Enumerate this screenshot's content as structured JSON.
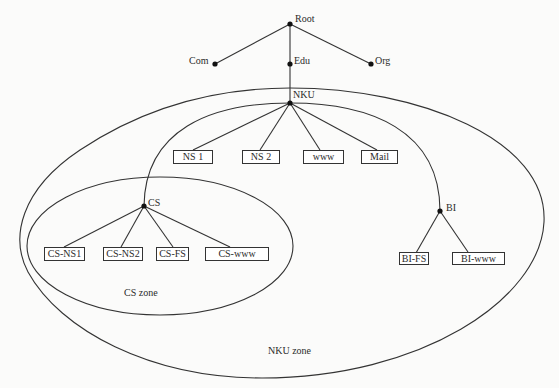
{
  "diagram": {
    "type": "DNS hierarchy with zones",
    "colors": {
      "line": "#333333",
      "background": "#fbfbfa",
      "text": "#2b2b2b"
    },
    "nodes": {
      "root": {
        "label": "Root"
      },
      "com": {
        "label": "Com"
      },
      "edu": {
        "label": "Edu"
      },
      "org": {
        "label": "Org"
      },
      "nku": {
        "label": "NKU"
      },
      "cs": {
        "label": "CS"
      },
      "bi": {
        "label": "BI"
      }
    },
    "nku_servers": [
      "NS 1",
      "NS 2",
      "www",
      "Mail"
    ],
    "cs_servers": [
      "CS-NS1",
      "CS-NS2",
      "CS-FS",
      "CS-www"
    ],
    "bi_servers": [
      "BI-FS",
      "BI-www"
    ],
    "zones": {
      "cs_zone": {
        "label": "CS zone"
      },
      "nku_zone": {
        "label": "NKU zone"
      }
    },
    "edges": [
      [
        "Root",
        "Com"
      ],
      [
        "Root",
        "Edu"
      ],
      [
        "Root",
        "Org"
      ],
      [
        "Edu",
        "NKU"
      ],
      [
        "NKU",
        "NS 1"
      ],
      [
        "NKU",
        "NS 2"
      ],
      [
        "NKU",
        "www"
      ],
      [
        "NKU",
        "Mail"
      ],
      [
        "NKU",
        "CS"
      ],
      [
        "NKU",
        "BI"
      ],
      [
        "CS",
        "CS-NS1"
      ],
      [
        "CS",
        "CS-NS2"
      ],
      [
        "CS",
        "CS-FS"
      ],
      [
        "CS",
        "CS-www"
      ],
      [
        "BI",
        "BI-FS"
      ],
      [
        "BI",
        "BI-www"
      ]
    ]
  }
}
